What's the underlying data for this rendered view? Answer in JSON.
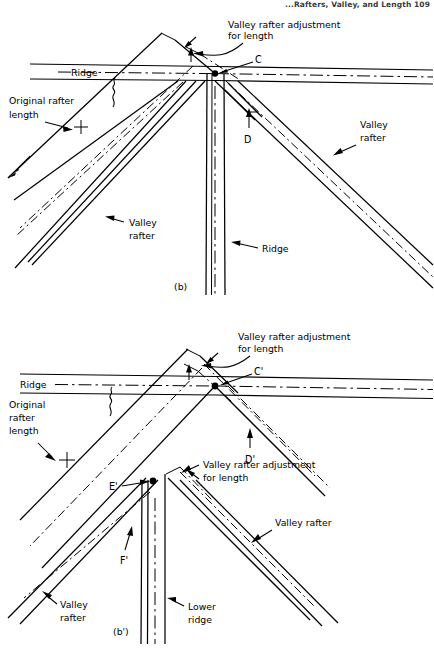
{
  "page": {
    "header": "...Rafters, Valley, and Length    109",
    "width": 434,
    "height": 653
  },
  "figures": [
    {
      "id": "fig-b",
      "caption": "(b)",
      "labels": {
        "valley_rafter_adjustment": "Valley rafter adjustment",
        "for_length": "for length",
        "ridge_horizontal": "Ridge",
        "original_rafter": "Original rafter",
        "original_rafter_length": "length",
        "point_c": "C",
        "point_d": "D",
        "valley_right_line1": "Valley",
        "valley_right_line2": "rafter",
        "valley_left_line1": "Valley",
        "valley_left_line2": "rafter",
        "ridge_vertical": "Ridge"
      }
    },
    {
      "id": "fig-b-prime",
      "caption": "(b')",
      "labels": {
        "valley_rafter_adjustment": "Valley rafter adjustment",
        "for_length": "for length",
        "ridge_horizontal": "Ridge",
        "original_line1": "Original",
        "original_line2": "rafter",
        "original_line3": "length",
        "point_c_prime": "C'",
        "point_d_prime": "D'",
        "point_e_prime": "E'",
        "point_f_prime": "F'",
        "valley_rafter_adjustment_2": "Valley rafter adjustment",
        "for_length_2": "for length",
        "valley_right_line1": "Valley rafter",
        "valley_left_line1": "Valley",
        "valley_left_line2": "rafter",
        "lower_ridge_line1": "Lower",
        "lower_ridge_line2": "ridge"
      }
    }
  ],
  "colors": {
    "ink": "#000000",
    "paper": "#ffffff",
    "header_ink": "#3a3a3a"
  }
}
